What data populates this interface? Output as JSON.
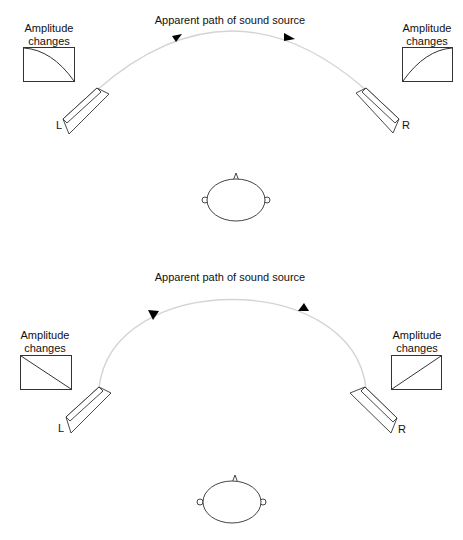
{
  "diagrams": [
    {
      "id": "curved-panning",
      "title": "Apparent path of sound source",
      "left_box": {
        "label_line1": "Amplitude",
        "label_line2": "changes",
        "curve": "convex-decreasing"
      },
      "right_box": {
        "label_line1": "Amplitude",
        "label_line2": "changes",
        "curve": "convex-increasing"
      },
      "left_speaker": {
        "label": "L"
      },
      "right_speaker": {
        "label": "R"
      },
      "arrows": [
        "left-to-right",
        "left-to-right"
      ],
      "listener": "head-top-view"
    },
    {
      "id": "linear-panning",
      "title": "Apparent path of sound source",
      "left_box": {
        "label_line1": "Amplitude",
        "label_line2": "changes",
        "curve": "linear-decreasing"
      },
      "right_box": {
        "label_line1": "Amplitude",
        "label_line2": "changes",
        "curve": "linear-increasing"
      },
      "left_speaker": {
        "label": "L"
      },
      "right_speaker": {
        "label": "R"
      },
      "arrows": [
        "down-left",
        "up-right"
      ],
      "listener": "head-top-view"
    }
  ],
  "colors": {
    "stroke": "#333333",
    "path": "#d4d4d4",
    "arrow": "#000000"
  }
}
